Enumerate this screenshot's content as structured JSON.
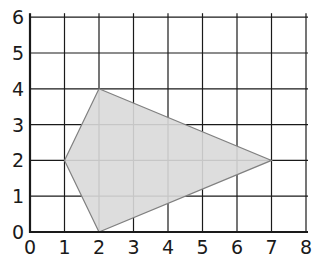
{
  "diagram": {
    "type": "coordinate-grid-polygon",
    "x_ticks": [
      "0",
      "1",
      "2",
      "3",
      "4",
      "5",
      "6",
      "7",
      "8"
    ],
    "y_ticks": [
      "0",
      "1",
      "2",
      "3",
      "4",
      "5",
      "6"
    ],
    "polygon": {
      "vertices": [
        [
          2,
          4
        ],
        [
          7,
          2
        ],
        [
          2,
          0
        ],
        [
          1,
          2
        ]
      ],
      "fill": "#d9d9d9",
      "stroke": "#808080"
    },
    "colors": {
      "grid": "#1a1a1a",
      "axis": "#1a1a1a",
      "background": "#ffffff"
    }
  }
}
